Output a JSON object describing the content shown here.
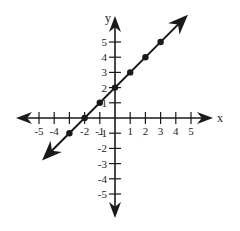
{
  "chart_data": {
    "type": "line",
    "title": "",
    "xlabel": "x",
    "ylabel": "y",
    "xlim": [
      -6.5,
      6.5
    ],
    "ylim": [
      -6.5,
      6.5
    ],
    "x_ticks": [
      -5,
      -4,
      -3,
      -2,
      -1,
      1,
      2,
      3,
      4,
      5
    ],
    "x_tick_labels": [
      "-5",
      "-4",
      "-2",
      "-1",
      "1",
      "2",
      "3",
      "4",
      "5"
    ],
    "x_tick_label_values": [
      -5,
      -4,
      -2,
      -1,
      1,
      2,
      3,
      4,
      5
    ],
    "y_ticks": [
      -5,
      -4,
      -3,
      -2,
      -1,
      1,
      2,
      3,
      4,
      5
    ],
    "y_tick_labels": [
      "-5",
      "-4",
      "-3",
      "-2",
      "-1",
      "1",
      "2",
      "3",
      "4",
      "5"
    ],
    "y_tick_label_values": [
      -5,
      -4,
      -3,
      -2,
      -1,
      1,
      2,
      3,
      4,
      5
    ],
    "grid": false,
    "legend": null,
    "equation": "y = x + 2",
    "series": [
      {
        "name": "y = x + 2",
        "x": [
          -3,
          -2,
          -1,
          0,
          1,
          2,
          3
        ],
        "y": [
          -1,
          0,
          1,
          2,
          3,
          4,
          5
        ],
        "line_extent": {
          "from": [
            -4.8,
            -2.8
          ],
          "to": [
            4.8,
            6.8
          ]
        },
        "arrows_both_ends": true,
        "markers": true
      }
    ],
    "axes_arrows": true
  },
  "layout": {
    "origin_px": [
      115,
      118
    ],
    "unit_px": 15.2,
    "color": "#1a1a1a"
  }
}
